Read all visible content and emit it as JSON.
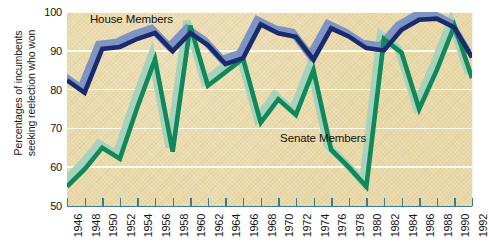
{
  "chart_data": {
    "type": "line",
    "title": "",
    "xlabel": "",
    "ylabel": "Percentages of incumbents\nseeking reelection who won",
    "ylim": [
      50,
      100
    ],
    "yticks": [
      50,
      60,
      70,
      80,
      90,
      100
    ],
    "ytick_labels": [
      "50",
      "60",
      "70",
      "80",
      "90",
      "100"
    ],
    "grid": true,
    "legend_position": "inline-annotation",
    "x": [
      1946,
      1948,
      1950,
      1952,
      1954,
      1956,
      1958,
      1960,
      1962,
      1964,
      1966,
      1968,
      1970,
      1972,
      1974,
      1976,
      1978,
      1980,
      1982,
      1984,
      1986,
      1988,
      1990,
      1992
    ],
    "xtick_labels": [
      "1946",
      "1948",
      "1950",
      "1952",
      "1954",
      "1956",
      "1958",
      "1960",
      "1962",
      "1964",
      "1966",
      "1968",
      "1970",
      "1972",
      "1974",
      "1976",
      "1978",
      "1980",
      "1982",
      "1984",
      "1986",
      "1988",
      "1990",
      "1992"
    ],
    "series": [
      {
        "name": "House Members",
        "color": "#1b2a6b",
        "shadow_color": "#7d94c4",
        "values": [
          82.4,
          79.2,
          90.5,
          91.0,
          93.1,
          94.6,
          89.9,
          94.6,
          91.5,
          86.6,
          88.1,
          96.8,
          94.5,
          93.6,
          87.7,
          95.8,
          93.7,
          90.7,
          90.1,
          95.4,
          98.0,
          98.3,
          96.0,
          88.3
        ]
      },
      {
        "name": "Senate Members",
        "color": "#10885a",
        "shadow_color": "#a7d2bc",
        "values": [
          55.0,
          59.5,
          65.0,
          62.2,
          75.5,
          87.8,
          64.0,
          96.5,
          81.0,
          84.5,
          88.0,
          71.5,
          77.5,
          73.5,
          85.0,
          64.5,
          60.0,
          55.0,
          93.0,
          89.5,
          75.0,
          85.0,
          96.5,
          83.0
        ]
      }
    ],
    "annotations": [
      {
        "text": "House Members",
        "x": 1948.6,
        "y": 98.0
      },
      {
        "text": "Senate Members",
        "x": 1970.2,
        "y": 67.2
      }
    ]
  },
  "colors": {
    "plot_background": "#e9d9a8",
    "gridline": "#fdfbf0",
    "axis": "#3a7c96",
    "house": "#1b2a6b",
    "house_shadow": "#7d94c4",
    "senate": "#10885a",
    "senate_shadow": "#a7d2bc",
    "text": "#141414"
  }
}
